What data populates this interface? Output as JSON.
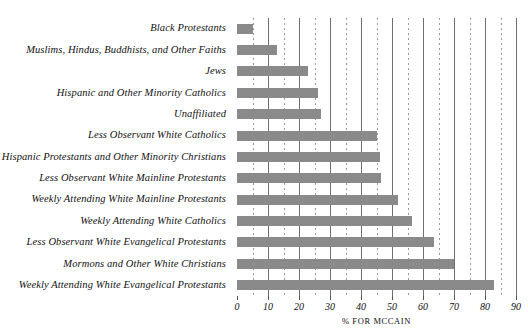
{
  "chart_data": {
    "type": "bar",
    "orientation": "horizontal",
    "title": "",
    "xlabel": "% FOR MCCAIN",
    "ylabel": "",
    "xlim": [
      0,
      90
    ],
    "xticks": [
      0,
      10,
      20,
      30,
      40,
      50,
      60,
      70,
      80,
      90
    ],
    "xtick_labels": [
      "0",
      "10",
      "20",
      "30",
      "40",
      "50",
      "60",
      "70",
      "80",
      "90"
    ],
    "minor_ticks": [
      5,
      15,
      25,
      35,
      45,
      55,
      65,
      75,
      85
    ],
    "grid": true,
    "legend": null,
    "bar_color": "#8a8a8a",
    "categories": [
      "Black Protestants",
      "Muslims, Hindus, Buddhists, and Other Faiths",
      "Jews",
      "Hispanic and Other Minority Catholics",
      "Unaffiliated",
      "Less Observant White Catholics",
      "Hispanic Protestants and Other Minority Christians",
      "Less Observant White Mainline Protestants",
      "Weekly Attending White Mainline Protestants",
      "Weekly Attending White Catholics",
      "Less Observant White Evangelical Protestants",
      "Mormons and Other White Christians",
      "Weekly Attending White Evangelical Protestants"
    ],
    "values": [
      5,
      13,
      23,
      26,
      27,
      45,
      46,
      46.5,
      52,
      56.5,
      63.5,
      70,
      83
    ]
  }
}
